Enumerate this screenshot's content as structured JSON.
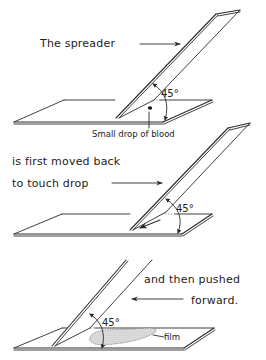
{
  "diagram": {
    "steps": [
      {
        "id": "step-1",
        "label": "The spreader",
        "annotation": "Small drop of blood",
        "angle_label": "45°"
      },
      {
        "id": "step-2",
        "label_line1": "is first moved back",
        "label_line2": "to touch drop",
        "angle_label": "45°"
      },
      {
        "id": "step-3",
        "label_line1": "and then pushed",
        "label_line2": "forward.",
        "annotation": "film",
        "angle_label": "45°"
      }
    ]
  },
  "colors": {
    "ink": "#2a2a2a",
    "film": "#8a8a8a",
    "background": "#ffffff"
  }
}
